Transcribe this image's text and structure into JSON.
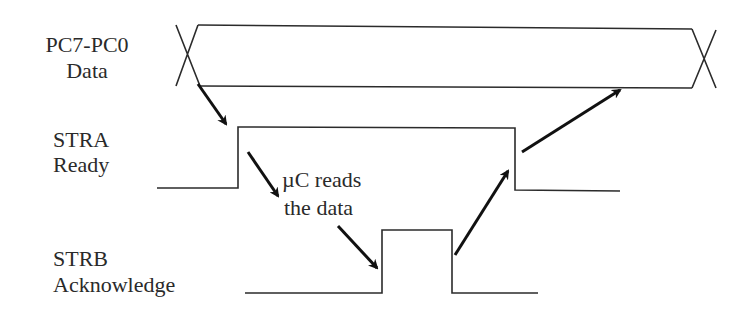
{
  "diagram": {
    "type": "timing-diagram",
    "signals": [
      {
        "id": "data",
        "name": "PC7-PC0",
        "description": "Data"
      },
      {
        "id": "stra",
        "name": "STRA",
        "description": "Ready"
      },
      {
        "id": "strb",
        "name": "STRB",
        "description": "Acknowledge"
      }
    ],
    "annotation": {
      "line1": "µC reads",
      "line2": "the data"
    },
    "sequence": [
      {
        "from": "data valid",
        "to": "STRA rises"
      },
      {
        "from": "STRA rises",
        "to": "µC reads the data"
      },
      {
        "from": "µC reads the data",
        "to": "STRB rises"
      },
      {
        "from": "STRB falls",
        "to": "STRA falls"
      },
      {
        "from": "STRA falls",
        "to": "data change"
      }
    ]
  }
}
